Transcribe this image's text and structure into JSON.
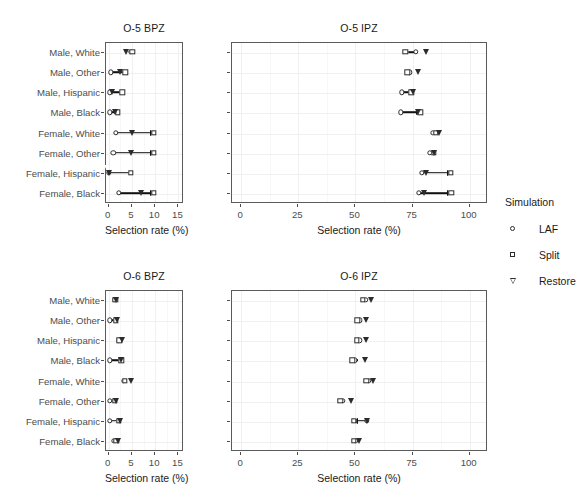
{
  "figure": {
    "xlabel": "Selection rate (%)",
    "categories": [
      "Male, White",
      "Male, Other",
      "Male, Hispanic",
      "Male, Black",
      "Female, White",
      "Female, Other",
      "Female, Hispanic",
      "Female, Black"
    ],
    "legend": {
      "title": "Simulation",
      "entries": [
        {
          "label": "LAF",
          "marker": "circle-open"
        },
        {
          "label": "Split",
          "marker": "square-open"
        },
        {
          "label": "Restore",
          "marker": "triangle-down-open"
        }
      ]
    }
  },
  "chart_data": [
    {
      "type": "scatter",
      "panel": "top-left",
      "title": "O-5 BPZ",
      "xlabel": "Selection rate (%)",
      "ylabel": "",
      "xlim": [
        -0.6,
        16.2
      ],
      "xticks": [
        0,
        5,
        10,
        15
      ],
      "xticklabels": [
        "0",
        "5",
        "10",
        "15"
      ],
      "grid": true,
      "categories": [
        "Male, White",
        "Male, Other",
        "Male, Hispanic",
        "Male, Black",
        "Female, White",
        "Female, Other",
        "Female, Hispanic",
        "Female, Black"
      ],
      "series": [
        {
          "name": "LAF",
          "values": [
            5.0,
            0.7,
            0.4,
            0.4,
            1.7,
            1.2,
            0.2,
            2.4
          ]
        },
        {
          "name": "Split",
          "values": [
            5.3,
            3.8,
            3.1,
            2.2,
            9.9,
            9.9,
            5.0,
            9.9
          ]
        },
        {
          "name": "Restore",
          "values": [
            4.0,
            2.6,
            0.9,
            1.6,
            5.2,
            5.0,
            0.2,
            7.2
          ]
        }
      ],
      "connectors": [
        {
          "category": "Male, White",
          "from": 5.0,
          "to": 5.3,
          "arrow": "none"
        },
        {
          "category": "Male, Other",
          "from": 0.7,
          "to": 3.8,
          "arrow": "none"
        },
        {
          "category": "Male, Hispanic",
          "from": 0.4,
          "to": 3.1,
          "arrow": "none"
        },
        {
          "category": "Male, Black",
          "from": 0.4,
          "to": 2.2,
          "arrow": "none"
        },
        {
          "category": "Female, White",
          "from": 1.7,
          "to": 9.9,
          "arrow": "right"
        },
        {
          "category": "Female, Other",
          "from": 1.2,
          "to": 9.9,
          "arrow": "right"
        },
        {
          "category": "Female, Hispanic",
          "from": 0.2,
          "to": 5.0,
          "arrow": "none"
        },
        {
          "category": "Female, Black",
          "from": 2.4,
          "to": 9.9,
          "arrow": "right"
        }
      ]
    },
    {
      "type": "scatter",
      "panel": "top-right",
      "title": "O-5 IPZ",
      "xlabel": "Selection rate (%)",
      "ylabel": "",
      "xlim": [
        -4.0,
        108.0
      ],
      "xticks": [
        0,
        25,
        50,
        75,
        100
      ],
      "xticklabels": [
        "0",
        "25",
        "50",
        "75",
        "100"
      ],
      "grid": true,
      "categories": [
        "Male, White",
        "Male, Other",
        "Male, Hispanic",
        "Male, Black",
        "Female, White",
        "Female, Other",
        "Female, Hispanic",
        "Female, Black"
      ],
      "series": [
        {
          "name": "LAF",
          "values": [
            76.8,
            74.0,
            70.7,
            70.2,
            84.4,
            83.0,
            79.4,
            78.2
          ]
        },
        {
          "name": "Split",
          "values": [
            72.3,
            73.1,
            74.8,
            78.8,
            85.7,
            84.6,
            92.2,
            92.4
          ]
        },
        {
          "name": "Restore",
          "values": [
            81.3,
            78.0,
            75.6,
            77.9,
            87.0,
            84.9,
            81.3,
            80.6
          ]
        }
      ],
      "connectors": [
        {
          "category": "Male, White",
          "from": 72.3,
          "to": 76.8,
          "arrow": "none"
        },
        {
          "category": "Male, Other",
          "from": 73.1,
          "to": 74.0,
          "arrow": "none"
        },
        {
          "category": "Male, Hispanic",
          "from": 70.7,
          "to": 74.8,
          "arrow": "none"
        },
        {
          "category": "Male, Black",
          "from": 70.2,
          "to": 78.8,
          "arrow": "right"
        },
        {
          "category": "Female, White",
          "from": 84.4,
          "to": 85.7,
          "arrow": "none"
        },
        {
          "category": "Female, Other",
          "from": 83.0,
          "to": 84.6,
          "arrow": "none"
        },
        {
          "category": "Female, Hispanic",
          "from": 79.4,
          "to": 92.2,
          "arrow": "right"
        },
        {
          "category": "Female, Black",
          "from": 78.2,
          "to": 92.4,
          "arrow": "right"
        }
      ]
    },
    {
      "type": "scatter",
      "panel": "bottom-left",
      "title": "O-6 BPZ",
      "xlabel": "Selection rate (%)",
      "ylabel": "",
      "xlim": [
        -0.6,
        16.2
      ],
      "xticks": [
        0,
        5,
        10,
        15
      ],
      "xticklabels": [
        "0",
        "5",
        "10",
        "15"
      ],
      "grid": true,
      "categories": [
        "Male, White",
        "Male, Other",
        "Male, Hispanic",
        "Male, Black",
        "Female, White",
        "Female, Other",
        "Female, Hispanic",
        "Female, Black"
      ],
      "series": [
        {
          "name": "LAF",
          "values": [
            1.5,
            0.4,
            2.4,
            0.4,
            3.5,
            0.4,
            0.5,
            1.3
          ]
        },
        {
          "name": "Split",
          "values": [
            1.6,
            1.7,
            2.5,
            2.9,
            3.7,
            1.5,
            2.4,
            1.8
          ]
        },
        {
          "name": "Restore",
          "values": [
            1.8,
            2.0,
            3.1,
            2.9,
            5.0,
            1.7,
            2.6,
            2.2
          ]
        }
      ],
      "connectors": [
        {
          "category": "Male, White",
          "from": 1.5,
          "to": 1.6,
          "arrow": "none"
        },
        {
          "category": "Male, Other",
          "from": 0.4,
          "to": 1.7,
          "arrow": "none"
        },
        {
          "category": "Male, Hispanic",
          "from": 2.4,
          "to": 2.5,
          "arrow": "none"
        },
        {
          "category": "Male, Black",
          "from": 0.4,
          "to": 2.9,
          "arrow": "none"
        },
        {
          "category": "Female, White",
          "from": 3.5,
          "to": 3.7,
          "arrow": "none"
        },
        {
          "category": "Female, Other",
          "from": 0.4,
          "to": 1.5,
          "arrow": "none"
        },
        {
          "category": "Female, Hispanic",
          "from": 0.5,
          "to": 2.4,
          "arrow": "none"
        },
        {
          "category": "Female, Black",
          "from": 1.3,
          "to": 1.8,
          "arrow": "none"
        }
      ]
    },
    {
      "type": "scatter",
      "panel": "bottom-right",
      "title": "O-6 IPZ",
      "xlabel": "Selection rate (%)",
      "ylabel": "",
      "xlim": [
        -4.0,
        108.0
      ],
      "xticks": [
        0,
        25,
        50,
        75,
        100
      ],
      "xticklabels": [
        "0",
        "25",
        "50",
        "75",
        "100"
      ],
      "grid": true,
      "categories": [
        "Male, White",
        "Male, Other",
        "Male, Hispanic",
        "Male, Black",
        "Female, White",
        "Female, Other",
        "Female, Hispanic",
        "Female, Black"
      ],
      "series": [
        {
          "name": "LAF",
          "values": [
            54.8,
            52.4,
            52.2,
            50.1,
            56.2,
            45.0,
            55.4,
            50.7
          ]
        },
        {
          "name": "Split",
          "values": [
            53.6,
            51.3,
            51.1,
            49.0,
            55.2,
            43.8,
            49.8,
            49.8
          ]
        },
        {
          "name": "Restore",
          "values": [
            57.2,
            55.2,
            55.0,
            54.7,
            58.0,
            48.5,
            55.6,
            52.2
          ]
        }
      ],
      "connectors": [
        {
          "category": "Male, White",
          "from": 53.6,
          "to": 54.8,
          "arrow": "none"
        },
        {
          "category": "Male, Other",
          "from": 51.3,
          "to": 52.4,
          "arrow": "none"
        },
        {
          "category": "Male, Hispanic",
          "from": 51.1,
          "to": 52.2,
          "arrow": "none"
        },
        {
          "category": "Male, Black",
          "from": 49.0,
          "to": 51.5,
          "arrow": "none"
        },
        {
          "category": "Female, White",
          "from": 55.2,
          "to": 56.2,
          "arrow": "none"
        },
        {
          "category": "Female, Other",
          "from": 43.8,
          "to": 45.0,
          "arrow": "none"
        },
        {
          "category": "Female, Hispanic",
          "from": 55.4,
          "to": 49.8,
          "arrow": "left"
        },
        {
          "category": "Female, Black",
          "from": 49.8,
          "to": 50.7,
          "arrow": "none"
        }
      ]
    }
  ]
}
